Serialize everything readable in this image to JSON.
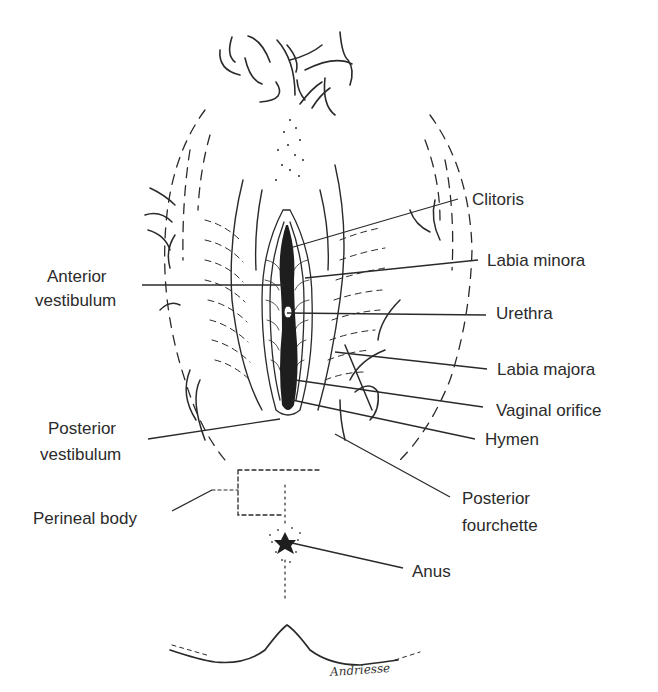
{
  "diagram": {
    "signature": "Andriesse",
    "labels": {
      "clitoris": "Clitoris",
      "labia_minora": "Labia minora",
      "anterior_vestibulum_1": "Anterior",
      "anterior_vestibulum_2": "vestibulum",
      "urethra": "Urethra",
      "labia_majora": "Labia majora",
      "vaginal_orifice": "Vaginal orifice",
      "hymen": "Hymen",
      "posterior_vestibulum_1": "Posterior",
      "posterior_vestibulum_2": "vestibulum",
      "perineal_body": "Perineal body",
      "posterior_fourchette_1": "Posterior",
      "posterior_fourchette_2": "fourchette",
      "anus": "Anus"
    },
    "colors": {
      "ink": "#2a2a2a",
      "background": "#ffffff"
    }
  }
}
